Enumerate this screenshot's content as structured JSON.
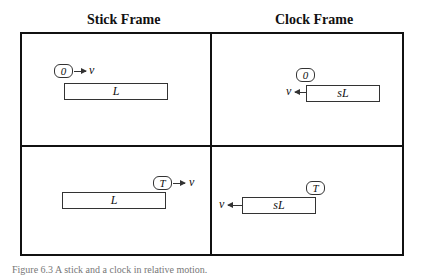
{
  "headers": {
    "left": "Stick Frame",
    "right": "Clock Frame"
  },
  "panels": {
    "top_left": {
      "clock": "0",
      "velocity": "v",
      "rod": "L"
    },
    "top_right": {
      "clock": "0",
      "velocity": "v",
      "rod": "sL"
    },
    "bottom_left": {
      "clock": "T",
      "velocity": "v",
      "rod": "L"
    },
    "bottom_right": {
      "clock": "T",
      "velocity": "v",
      "rod": "sL"
    }
  },
  "caption": "Figure 6.3  A stick and a clock in relative motion."
}
